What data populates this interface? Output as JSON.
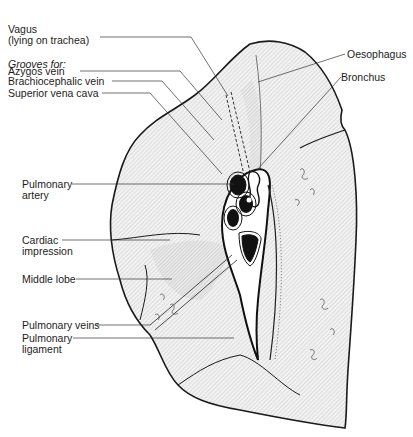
{
  "diagram": {
    "labels": {
      "vagus": {
        "line1": "Vagus",
        "line2": "(lying on trachea)"
      },
      "grooves_heading": "Grooves for:",
      "azygos": "Azygos vein",
      "brachiocephalic": "Brachiocephalic vein",
      "svc": "Superior vena cava",
      "pulm_artery": {
        "line1": "Pulmonary",
        "line2": "artery"
      },
      "cardiac": {
        "line1": "Cardiac",
        "line2": "impression"
      },
      "middle_lobe": "Middle lobe",
      "pulm_veins": "Pulmonary veins",
      "pulm_ligament": {
        "line1": "Pulmonary",
        "line2": "ligament"
      },
      "oesophagus": "Oesophagus",
      "bronchus": "Bronchus"
    },
    "colors": {
      "ink": "#1a1a1a",
      "shade": "#d9d9d9",
      "background": "#ffffff"
    }
  }
}
